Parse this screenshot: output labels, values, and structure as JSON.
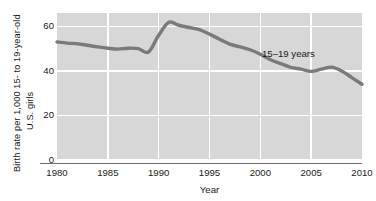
{
  "chart_data": {
    "type": "line",
    "title": "",
    "xlabel": "Year",
    "ylabel_line1": "Birth rate per 1,000 15- to 19-year-old",
    "ylabel_line2": "U.S. girls",
    "xlim": [
      1980,
      2010
    ],
    "ylim": [
      0,
      66
    ],
    "xticks": [
      1980,
      1985,
      1990,
      1995,
      2000,
      2005,
      2010
    ],
    "yticks": [
      0,
      20,
      40,
      60
    ],
    "grid": true,
    "legend_position": "inline-annotation",
    "series": [
      {
        "name": "15–19 years",
        "annotation": "15–19 years",
        "color": "#7a7a7a",
        "x": [
          1980,
          1981,
          1982,
          1983,
          1984,
          1985,
          1986,
          1987,
          1988,
          1989,
          1990,
          1991,
          1992,
          1993,
          1994,
          1995,
          1996,
          1997,
          1998,
          1999,
          2000,
          2001,
          2002,
          2003,
          2004,
          2005,
          2006,
          2007,
          2008,
          2009,
          2010
        ],
        "values": [
          53.0,
          52.5,
          52.2,
          51.5,
          50.8,
          50.2,
          49.8,
          50.2,
          50.0,
          48.5,
          56.0,
          61.8,
          60.5,
          59.5,
          58.5,
          56.5,
          54.2,
          52.0,
          50.8,
          49.5,
          47.5,
          45.0,
          43.3,
          41.6,
          40.8,
          39.8,
          40.8,
          41.7,
          40.0,
          37.0,
          34.0
        ]
      }
    ]
  }
}
